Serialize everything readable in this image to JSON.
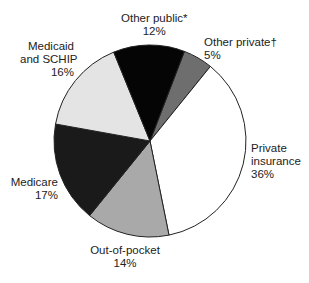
{
  "chart_data": {
    "type": "pie",
    "title": "",
    "center": [
      150,
      141
    ],
    "radius": 96,
    "start_angle_deg": -69,
    "slices": [
      {
        "name": "Other private",
        "label_lines": [
          "Other private†",
          "5%"
        ],
        "value": 5,
        "color": "#6e6e6e"
      },
      {
        "name": "Private insurance",
        "label_lines": [
          "Private",
          "insurance",
          "36%"
        ],
        "value": 36,
        "color": "#ffffff"
      },
      {
        "name": "Out-of-pocket",
        "label_lines": [
          "Out-of-pocket",
          "14%"
        ],
        "value": 14,
        "color": "#a9a9a9"
      },
      {
        "name": "Medicare",
        "label_lines": [
          "Medicare",
          "17%"
        ],
        "value": 17,
        "color": "#1a1a1a"
      },
      {
        "name": "Medicaid and SCHIP",
        "label_lines": [
          "Medicaid",
          "and SCHIP",
          "16%"
        ],
        "value": 16,
        "color": "#e4e4e4"
      },
      {
        "name": "Other public",
        "label_lines": [
          "Other public*",
          "12%"
        ],
        "value": 12,
        "color": "#050505"
      }
    ],
    "stroke": "#222222"
  },
  "labels": {
    "other_public": {
      "line1": "Other public*",
      "line2": "12%"
    },
    "other_private": {
      "line1": "Other private†",
      "line2": "5%"
    },
    "medicaid": {
      "line1": "Medicaid",
      "line2": "and SCHIP",
      "line3": "16%"
    },
    "private_insurance": {
      "line1": "Private",
      "line2": "insurance",
      "line3": "36%"
    },
    "medicare": {
      "line1": "Medicare",
      "line2": "17%"
    },
    "out_of_pocket": {
      "line1": "Out-of-pocket",
      "line2": "14%"
    }
  }
}
